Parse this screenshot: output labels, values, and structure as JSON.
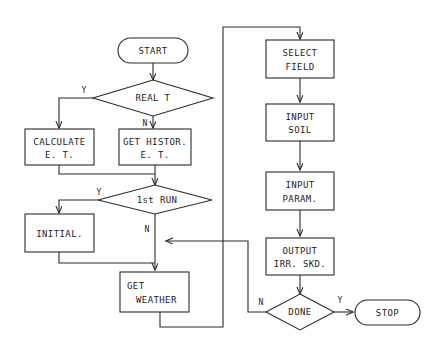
{
  "diagram": {
    "background_color": "#fefefe",
    "line_color": "#2b2b2b",
    "text_color": "#1c1c1c",
    "nodes": {
      "start": {
        "label": "START",
        "shape": "terminator"
      },
      "real_t": {
        "label": "REAL T",
        "shape": "decision"
      },
      "calculate_et": {
        "line1": "CALCULATE",
        "line2": "E. T.",
        "shape": "process"
      },
      "get_histor_et": {
        "line1": "GET HISTOR.",
        "line2": "E. T.",
        "shape": "process"
      },
      "first_run": {
        "label": "1st RUN",
        "shape": "decision"
      },
      "initial": {
        "label": "INITIAL.",
        "shape": "process"
      },
      "get_weather": {
        "line1": "GET",
        "line2": "WEATHER",
        "shape": "process"
      },
      "select_field": {
        "line1": "SELECT",
        "line2": "FIELD",
        "shape": "process"
      },
      "input_soil": {
        "line1": "INPUT",
        "line2": "SOIL",
        "shape": "process"
      },
      "input_param": {
        "line1": "INPUT",
        "line2": "PARAM.",
        "shape": "process"
      },
      "output_irr_skd": {
        "line1": "OUTPUT",
        "line2": "IRR. SKD.",
        "shape": "process"
      },
      "done": {
        "label": "DONE",
        "shape": "decision"
      },
      "stop": {
        "label": "STOP",
        "shape": "terminator"
      }
    },
    "edge_labels": {
      "real_t_yes": "Y",
      "real_t_no": "N",
      "first_run_yes": "Y",
      "first_run_no": "N",
      "done_no": "N",
      "done_yes": "Y"
    }
  }
}
